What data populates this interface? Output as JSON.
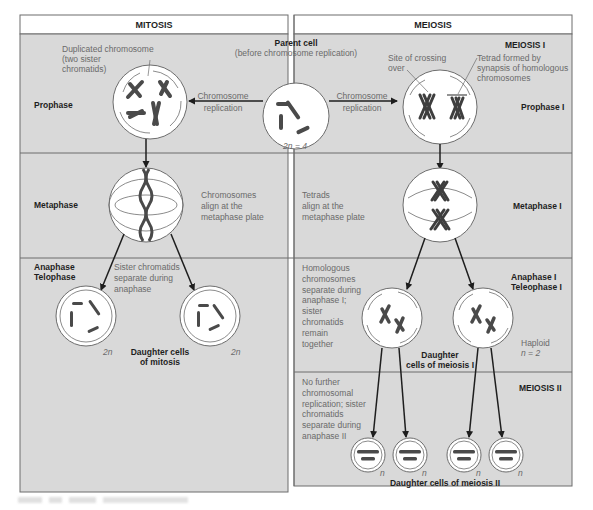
{
  "colors": {
    "panel_fill": "#d9d9d9",
    "header_fill": "#ffffff",
    "border": "#6d6d6d",
    "cell_fill": "#ffffff",
    "chromosome": "#4a4a4a",
    "arrow": "#1e1e1e",
    "label_gray": "#6a6a6a",
    "label_dark": "#1e1e1e"
  },
  "headers": {
    "mitosis": "MITOSIS",
    "meiosis": "MEIOSIS"
  },
  "parent_cell": {
    "title": "Parent cell",
    "subtitle": "(before chromosome replication)",
    "ploidy": "2n = 4"
  },
  "mitosis": {
    "prophase": {
      "stage_label": "Prophase",
      "annotation_line1": "Duplicated chromosome",
      "annotation_line2": "(two sister",
      "annotation_line3": "chromatids)",
      "arrow_line1": "Chromosome",
      "arrow_line2": "replication"
    },
    "metaphase": {
      "stage_label": "Metaphase",
      "note_line1": "Chromosomes",
      "note_line2": "align at the",
      "note_line3": "metaphase plate"
    },
    "anaphase": {
      "stage_label_line1": "Anaphase",
      "stage_label_line2": "Telophase",
      "note_line1": "Sister chromatids",
      "note_line2": "separate during",
      "note_line3": "anaphase",
      "left_ploidy": "2n",
      "right_ploidy": "2n",
      "daughter_line1": "Daughter cells",
      "daughter_line2": "of mitosis"
    }
  },
  "meiosis": {
    "meiosis1_label": "MEIOSIS I",
    "prophase1": {
      "stage_label": "Prophase I",
      "arrow_line1": "Chromosome",
      "arrow_line2": "replication",
      "crossing_line1": "Site of crossing",
      "crossing_line2": "over",
      "tetrad_line1": "Tetrad formed by",
      "tetrad_line2": "synapsis of homologous",
      "tetrad_line3": "chromosomes"
    },
    "metaphase1": {
      "stage_label": "Metaphase I",
      "note_line1": "Tetrads",
      "note_line2": "align at the",
      "note_line3": "metaphase plate"
    },
    "anaphase1": {
      "stage_label_line1": "Anaphase I",
      "stage_label_line2": "Teleophase I",
      "note_lines": [
        "Homologous",
        "chromosomes",
        "separate during",
        "anaphase I;",
        "sister",
        "chromatids",
        "remain",
        "together"
      ],
      "haploid_line1": "Haploid",
      "haploid_line2": "n = 2",
      "daughter_line1": "Daughter",
      "daughter_line2": "cells of meiosis I"
    },
    "meiosis2": {
      "label": "MEIOSIS II",
      "note_lines": [
        "No further",
        "chromosomal",
        "replication; sister",
        "chromatids",
        "separate during",
        "anaphase II"
      ],
      "ploidy": [
        "n",
        "n",
        "n",
        "n"
      ],
      "daughter_label": "Daughter cells of meiosis II"
    }
  }
}
